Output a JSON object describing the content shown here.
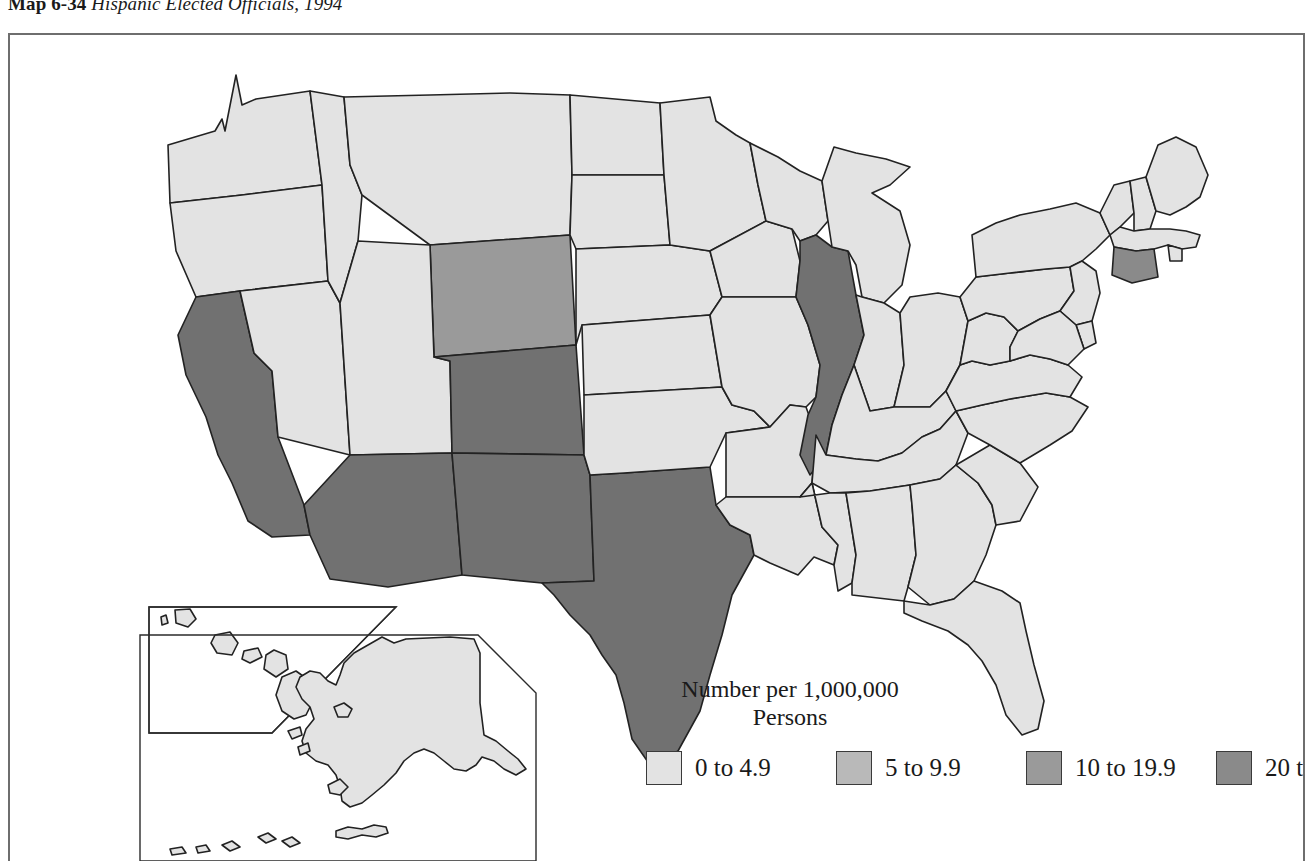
{
  "title": {
    "label": "Map 6-34",
    "name": "Hispanic Elected Officials, 1994"
  },
  "legend": {
    "heading_line1": "Number per 1,000,000",
    "heading_line2": "Persons",
    "items": [
      {
        "label": "0 to 4.9",
        "color": "#e3e3e3"
      },
      {
        "label": "5 to 9.9",
        "color": "#b9b9b9"
      },
      {
        "label": "10 to 19.9",
        "color": "#9a9a9a"
      },
      {
        "label": "20 to 39.9",
        "color": "#8a8a8a"
      },
      {
        "label": "40 to 433",
        "color": "#717171"
      }
    ]
  },
  "map": {
    "frame_color": "#6e6e6e",
    "state_border_color": "#222222",
    "insets": [
      {
        "name": "hawaii-inset"
      },
      {
        "name": "alaska-inset"
      }
    ],
    "state_values": [
      {
        "state": "Washington",
        "class": "0 to 4.9"
      },
      {
        "state": "Oregon",
        "class": "0 to 4.9"
      },
      {
        "state": "California",
        "class": "40 to 433"
      },
      {
        "state": "Nevada",
        "class": "0 to 4.9"
      },
      {
        "state": "Idaho",
        "class": "0 to 4.9"
      },
      {
        "state": "Montana",
        "class": "0 to 4.9"
      },
      {
        "state": "Wyoming",
        "class": "10 to 19.9"
      },
      {
        "state": "Utah",
        "class": "0 to 4.9"
      },
      {
        "state": "Arizona",
        "class": "40 to 433"
      },
      {
        "state": "Colorado",
        "class": "40 to 433"
      },
      {
        "state": "New Mexico",
        "class": "40 to 433"
      },
      {
        "state": "Texas",
        "class": "40 to 433"
      },
      {
        "state": "North Dakota",
        "class": "0 to 4.9"
      },
      {
        "state": "South Dakota",
        "class": "0 to 4.9"
      },
      {
        "state": "Nebraska",
        "class": "0 to 4.9"
      },
      {
        "state": "Kansas",
        "class": "0 to 4.9"
      },
      {
        "state": "Oklahoma",
        "class": "0 to 4.9"
      },
      {
        "state": "Minnesota",
        "class": "0 to 4.9"
      },
      {
        "state": "Iowa",
        "class": "0 to 4.9"
      },
      {
        "state": "Missouri",
        "class": "0 to 4.9"
      },
      {
        "state": "Arkansas",
        "class": "0 to 4.9"
      },
      {
        "state": "Louisiana",
        "class": "0 to 4.9"
      },
      {
        "state": "Wisconsin",
        "class": "0 to 4.9"
      },
      {
        "state": "Illinois",
        "class": "40 to 433"
      },
      {
        "state": "Michigan",
        "class": "0 to 4.9"
      },
      {
        "state": "Indiana",
        "class": "0 to 4.9"
      },
      {
        "state": "Ohio",
        "class": "0 to 4.9"
      },
      {
        "state": "Kentucky",
        "class": "0 to 4.9"
      },
      {
        "state": "Tennessee",
        "class": "0 to 4.9"
      },
      {
        "state": "Mississippi",
        "class": "0 to 4.9"
      },
      {
        "state": "Alabama",
        "class": "0 to 4.9"
      },
      {
        "state": "Georgia",
        "class": "0 to 4.9"
      },
      {
        "state": "Florida",
        "class": "0 to 4.9"
      },
      {
        "state": "South Carolina",
        "class": "0 to 4.9"
      },
      {
        "state": "North Carolina",
        "class": "0 to 4.9"
      },
      {
        "state": "Virginia",
        "class": "0 to 4.9"
      },
      {
        "state": "West Virginia",
        "class": "0 to 4.9"
      },
      {
        "state": "Pennsylvania",
        "class": "0 to 4.9"
      },
      {
        "state": "New York",
        "class": "0 to 4.9"
      },
      {
        "state": "Vermont",
        "class": "0 to 4.9"
      },
      {
        "state": "New Hampshire",
        "class": "0 to 4.9"
      },
      {
        "state": "Maine",
        "class": "0 to 4.9"
      },
      {
        "state": "Massachusetts",
        "class": "0 to 4.9"
      },
      {
        "state": "Rhode Island",
        "class": "0 to 4.9"
      },
      {
        "state": "Connecticut",
        "class": "20 to 39.9"
      },
      {
        "state": "New Jersey",
        "class": "0 to 4.9"
      },
      {
        "state": "Delaware",
        "class": "0 to 4.9"
      },
      {
        "state": "Maryland",
        "class": "0 to 4.9"
      },
      {
        "state": "Alaska",
        "class": "0 to 4.9"
      },
      {
        "state": "Hawaii",
        "class": "0 to 4.9"
      }
    ]
  }
}
